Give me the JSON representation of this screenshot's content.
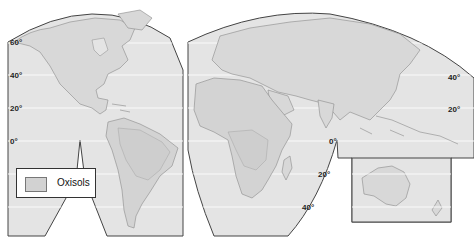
{
  "map": {
    "title": "",
    "colors": {
      "ocean": "#e4e4e4",
      "land": "#d9d9d9",
      "oxisols": "#cfcfcf",
      "outline": "#444444",
      "coast": "#8a8a8a",
      "latitude_line": "#ffffff"
    },
    "left_panel_labels": [
      {
        "text": "60°",
        "x": 10,
        "y": 38
      },
      {
        "text": "40°",
        "x": 10,
        "y": 71
      },
      {
        "text": "20°",
        "x": 10,
        "y": 104
      },
      {
        "text": "0°",
        "x": 10,
        "y": 137
      }
    ],
    "right_panel_labels": [
      {
        "text": "40°",
        "x": 448,
        "y": 73
      },
      {
        "text": "20°",
        "x": 448,
        "y": 105
      },
      {
        "text": "0°",
        "x": 329,
        "y": 137
      },
      {
        "text": "20°",
        "x": 318,
        "y": 170
      },
      {
        "text": "40°",
        "x": 302,
        "y": 203
      }
    ],
    "legend": {
      "label": "Oxisols"
    }
  }
}
